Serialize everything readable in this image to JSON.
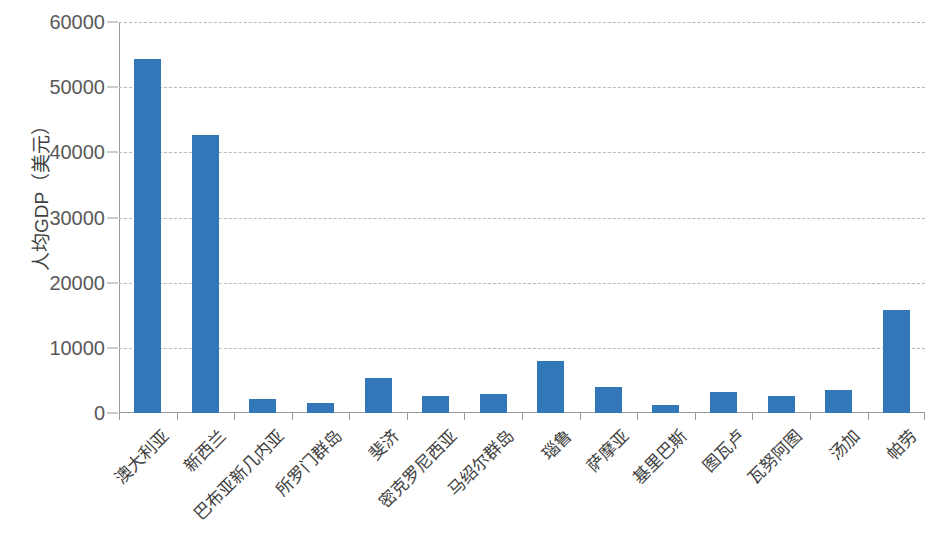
{
  "chart_data": {
    "type": "bar",
    "title": "",
    "subtitle": "",
    "xlabel": "",
    "ylabel": "人均GDP（美元）",
    "ylim": [
      0,
      60000
    ],
    "ytick_labels": [
      "60000",
      "50000",
      "40000",
      "30000",
      "20000",
      "10000",
      "0"
    ],
    "ytick_values": [
      60000,
      50000,
      40000,
      30000,
      20000,
      10000,
      0
    ],
    "grid": true,
    "grid_style": "dashed-horizontal",
    "legend": null,
    "legend_position": "none",
    "bar_color": "#3277B7",
    "axis_color": "#9a9a9a",
    "grid_color": "#b9b9b9",
    "text_color": "#404040",
    "categories": [
      "澳大利亚",
      "新西兰",
      "巴布亚新几内亚",
      "所罗门群岛",
      "斐济",
      "密克罗尼西亚",
      "马绍尔群岛",
      "瑙鲁",
      "萨摩亚",
      "基里巴斯",
      "图瓦卢",
      "瓦努阿图",
      "汤加",
      "帕劳"
    ],
    "values": [
      54300,
      42600,
      2150,
      1550,
      5400,
      2600,
      2900,
      8000,
      4000,
      1250,
      3200,
      2600,
      3550,
      15800
    ]
  }
}
